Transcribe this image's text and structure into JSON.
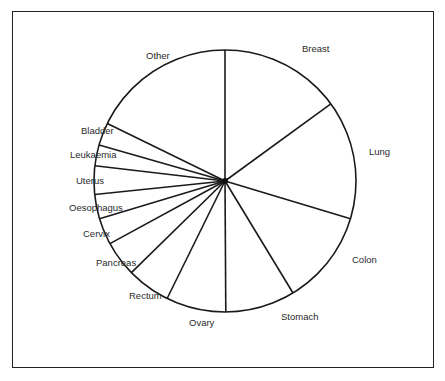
{
  "chart_data": {
    "type": "pie",
    "title": "",
    "start_angle_deg": 0,
    "direction": "clockwise",
    "categories": [
      "Breast",
      "Lung",
      "Colon",
      "Stomach",
      "Ovary",
      "Rectum",
      "Pancreas",
      "Cervix",
      "Oesophagus",
      "Uterus",
      "Leukaemia",
      "Bladder",
      "Other"
    ],
    "values": [
      15.0,
      14.7,
      11.7,
      8.6,
      7.4,
      5.4,
      4.4,
      3.3,
      3.0,
      3.5,
      2.6,
      2.8,
      17.8
    ],
    "unit": "percent (estimated from slice angles)",
    "labels_outside": true,
    "legend": "none",
    "fill_color": "#ffffff",
    "line_color": "#1a1a1a"
  },
  "layout": {
    "center": [
      225,
      181
    ],
    "radius": 131,
    "label_positions": {
      "Breast": [
        302,
        52
      ],
      "Lung": [
        369,
        155
      ],
      "Colon": [
        352,
        263
      ],
      "Stomach": [
        281,
        320
      ],
      "Ovary": [
        189,
        326
      ],
      "Rectum": [
        129,
        299
      ],
      "Pancreas": [
        96,
        266
      ],
      "Cervix": [
        83,
        237
      ],
      "Oesophagus": [
        69,
        211
      ],
      "Uterus": [
        76,
        184
      ],
      "Leukaemia": [
        70,
        158
      ],
      "Bladder": [
        81,
        134
      ],
      "Other": [
        146,
        59
      ]
    }
  }
}
